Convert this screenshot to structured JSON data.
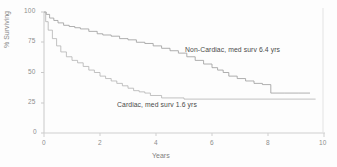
{
  "chart_data": {
    "type": "line",
    "title": "",
    "subtitle": "",
    "xlabel": "Years",
    "ylabel": "% Surviving",
    "xlim": [
      0,
      10
    ],
    "ylim": [
      0,
      100
    ],
    "grid": false,
    "legend_position": "inline-annotation",
    "xticks": [
      "0",
      "2",
      "4",
      "6",
      "8",
      "10"
    ],
    "xtick_values": [
      0,
      2,
      4,
      6,
      8,
      10
    ],
    "yticks": [
      "0",
      "25",
      "50",
      "75",
      "100"
    ],
    "ytick_values": [
      0,
      25,
      50,
      75,
      100
    ],
    "series": [
      {
        "name": "Non-Cardiac",
        "annotation": "Non-Cardiac, med  surv 6.4 yrs",
        "median_survival_years": 6.4,
        "color": "#9a9a9a",
        "x": [
          0,
          0.08,
          0.2,
          0.35,
          0.5,
          0.7,
          0.9,
          1.1,
          1.3,
          1.6,
          1.9,
          2.1,
          2.4,
          2.7,
          3.0,
          3.3,
          3.6,
          3.9,
          4.2,
          4.5,
          4.8,
          5.1,
          5.4,
          5.7,
          6.0,
          6.2,
          6.4,
          6.6,
          6.9,
          7.2,
          7.5,
          7.8,
          8.1,
          8.6,
          9.1,
          9.5
        ],
        "y": [
          100,
          98,
          95,
          93,
          91,
          89,
          88,
          87,
          86,
          84,
          82,
          81,
          80,
          78,
          77,
          75,
          74,
          72,
          70,
          68,
          66,
          63,
          60,
          57,
          54,
          52,
          50,
          47,
          45,
          43,
          41,
          40,
          33,
          33,
          33,
          33
        ]
      },
      {
        "name": "Cardiac",
        "annotation": "Cardiac, med  surv 1.6 yrs",
        "median_survival_years": 1.6,
        "color": "#b3b3b3",
        "x": [
          0,
          0.06,
          0.15,
          0.3,
          0.45,
          0.6,
          0.8,
          1.0,
          1.2,
          1.4,
          1.6,
          1.8,
          2.0,
          2.2,
          2.4,
          2.6,
          2.8,
          3.0,
          3.2,
          3.4,
          3.6,
          3.8,
          4.2,
          5.0,
          6.0,
          7.0,
          8.0,
          9.0,
          9.7
        ],
        "y": [
          100,
          92,
          85,
          78,
          72,
          67,
          63,
          60,
          58,
          55,
          52,
          50,
          47,
          45,
          43,
          41,
          39,
          37,
          35,
          34,
          33,
          31,
          29,
          28,
          28,
          28,
          28,
          28,
          28
        ]
      }
    ]
  },
  "axes": {
    "x_title": "Years",
    "y_title": "% Surviving"
  },
  "annotations": {
    "noncardiac": "Non-Cardiac, med  surv 6.4 yrs",
    "cardiac": "Cardiac, med  surv 1.6 yrs"
  }
}
